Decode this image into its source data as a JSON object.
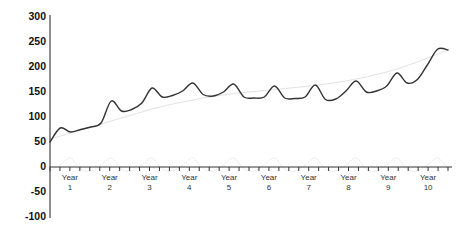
{
  "chart_data": {
    "type": "line",
    "title": "",
    "subtitle": "",
    "xlabel": "",
    "ylabel": "",
    "grid": false,
    "legend_position": "none",
    "ylim": [
      -100,
      300
    ],
    "ytick_labels": [
      "300",
      "250",
      "200",
      "150",
      "100",
      "50",
      "0",
      "-50",
      "-100"
    ],
    "ytick_values": [
      300,
      250,
      200,
      150,
      100,
      50,
      0,
      -50,
      -100
    ],
    "xtick_labels": [
      "Year 1",
      "Year 2",
      "Year 3",
      "Year 4",
      "Year 5",
      "Year 6",
      "Year 7",
      "Year 8",
      "Year 9",
      "Year 10"
    ],
    "xtick_label_lines": [
      [
        "Year",
        "1"
      ],
      [
        "Year",
        "2"
      ],
      [
        "Year",
        "3"
      ],
      [
        "Year",
        "4"
      ],
      [
        "Year",
        "5"
      ],
      [
        "Year",
        "6"
      ],
      [
        "Year",
        "7"
      ],
      [
        "Year",
        "8"
      ],
      [
        "Year",
        "9"
      ],
      [
        "Year",
        "10"
      ]
    ],
    "x_minor_ticks_per_year": 4,
    "x_minor_tick_count": 41,
    "categories": [
      "Y1Q1",
      "Y1Q2",
      "Y1Q3",
      "Y1Q4",
      "Y2Q1",
      "Y2Q2",
      "Y2Q3",
      "Y2Q4",
      "Y3Q1",
      "Y3Q2",
      "Y3Q3",
      "Y3Q4",
      "Y4Q1",
      "Y4Q2",
      "Y4Q3",
      "Y4Q4",
      "Y5Q1",
      "Y5Q2",
      "Y5Q3",
      "Y5Q4",
      "Y6Q1",
      "Y6Q2",
      "Y6Q3",
      "Y6Q4",
      "Y7Q1",
      "Y7Q2",
      "Y7Q3",
      "Y7Q4",
      "Y8Q1",
      "Y8Q2",
      "Y8Q3",
      "Y8Q4",
      "Y9Q1",
      "Y9Q2",
      "Y9Q3",
      "Y9Q4",
      "Y10Q1",
      "Y10Q2",
      "Y10Q3",
      "Y10Q4"
    ],
    "series": [
      {
        "name": "observed",
        "color": "#333333",
        "width": 1.4,
        "values": [
          50,
          78,
          70,
          75,
          80,
          88,
          132,
          112,
          115,
          128,
          158,
          140,
          143,
          152,
          168,
          145,
          142,
          150,
          166,
          140,
          138,
          140,
          162,
          138,
          137,
          140,
          164,
          135,
          136,
          152,
          172,
          150,
          152,
          162,
          188,
          168,
          175,
          205,
          236,
          234
        ]
      },
      {
        "name": "trend",
        "color": "#e2e2e2",
        "width": 1.0,
        "values": [
          56,
          62,
          68,
          74,
          80,
          86,
          92,
          98,
          104,
          110,
          116,
          121,
          126,
          130,
          134,
          138,
          141,
          144,
          147,
          149,
          151,
          153,
          155,
          157,
          159,
          161,
          163,
          166,
          169,
          172,
          176,
          180,
          185,
          190,
          196,
          203,
          210,
          218,
          226,
          234
        ]
      },
      {
        "name": "seasonal",
        "color": "#eeeeee",
        "width": 1.0,
        "values": [
          -8,
          4,
          18,
          -4,
          -8,
          4,
          18,
          -4,
          -8,
          4,
          18,
          -4,
          -8,
          4,
          18,
          -4,
          -8,
          4,
          18,
          -4,
          -8,
          4,
          18,
          -4,
          -8,
          4,
          18,
          -4,
          -8,
          4,
          18,
          -4,
          -8,
          4,
          18,
          -4,
          -8,
          4,
          18,
          -4
        ]
      }
    ]
  },
  "axis": {
    "zero_baseline_value": 0
  }
}
